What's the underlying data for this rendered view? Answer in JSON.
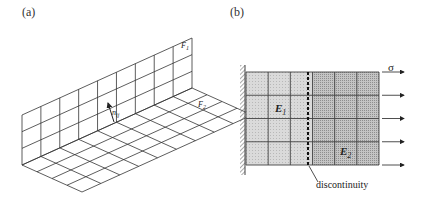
{
  "figure": {
    "panels": [
      {
        "id": "a",
        "label": "(a)",
        "description": "Isometric grid of two perpendicular surfaces (vertical wall and horizontal floor) with a normal vector at their junction",
        "surface_labels": {
          "wall": "F",
          "wall_sub": "1",
          "floor": "F",
          "floor_sub": "2"
        },
        "normal_label": "n",
        "normal_sub": "ij",
        "grid": {
          "wall_columns": 9,
          "wall_rows": 3,
          "floor_columns": 9,
          "floor_rows": 4
        }
      },
      {
        "id": "b",
        "label": "(b)",
        "description": "Plate clamped on the left, made of two materials with a discontinuity line, loaded by tensile stress on the right",
        "material_labels": [
          {
            "text": "E",
            "sub": "1"
          },
          {
            "text": "E",
            "sub": "2"
          }
        ],
        "load_label": "σ",
        "discontinuity_label": "discontinuity",
        "grid": {
          "columns": 6,
          "rows": 4
        },
        "colors": {
          "material1": "#d4d4d4",
          "material2": "#b9b9b9",
          "lines": "#444444"
        }
      }
    ]
  }
}
